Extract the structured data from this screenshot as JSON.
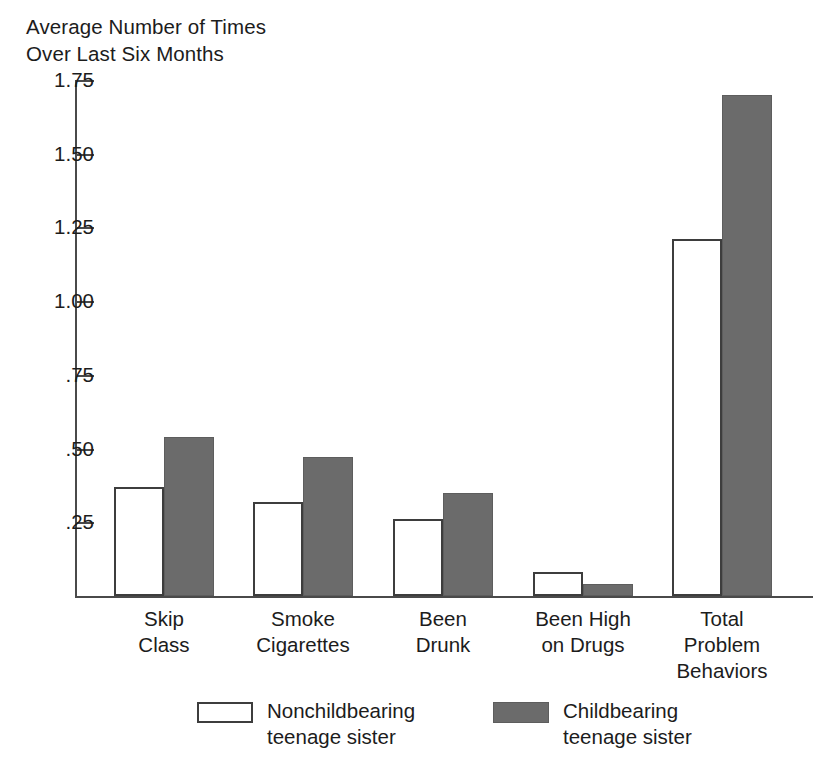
{
  "chart_data": {
    "type": "bar",
    "title": "Average Number of Times\nOver Last Six Months",
    "xlabel": "",
    "ylabel": "Average Number of Times Over Last Six Months",
    "ylim": [
      0,
      1.75
    ],
    "grid": false,
    "legend_position": "bottom",
    "ytick_labels": [
      "1.75",
      "1.50",
      "1.25",
      "1.00",
      ".75",
      ".50",
      ".25"
    ],
    "ytick_values": [
      1.75,
      1.5,
      1.25,
      1.0,
      0.75,
      0.5,
      0.25
    ],
    "categories": [
      "Skip\nClass",
      "Smoke\nCigarettes",
      "Been\nDrunk",
      "Been High\non Drugs",
      "Total\nProblem\nBehaviors"
    ],
    "series": [
      {
        "name": "Nonchildbearing\nteenage sister",
        "style": "light",
        "values": [
          0.37,
          0.32,
          0.26,
          0.08,
          1.21
        ]
      },
      {
        "name": "Childbearing\nteenage sister",
        "style": "dark",
        "values": [
          0.54,
          0.47,
          0.35,
          0.04,
          1.7
        ]
      }
    ]
  },
  "colors": {
    "light_fill": "#ffffff",
    "dark_fill": "#6b6b6b",
    "outline": "#3d3d3d",
    "axis": "#4a4a4a",
    "text": "#1c1c1c",
    "background": "#ffffff"
  },
  "legend": [
    {
      "label": "Nonchildbearing\nteenage sister",
      "style": "light"
    },
    {
      "label": "Childbearing\nteenage sister",
      "style": "dark"
    }
  ]
}
